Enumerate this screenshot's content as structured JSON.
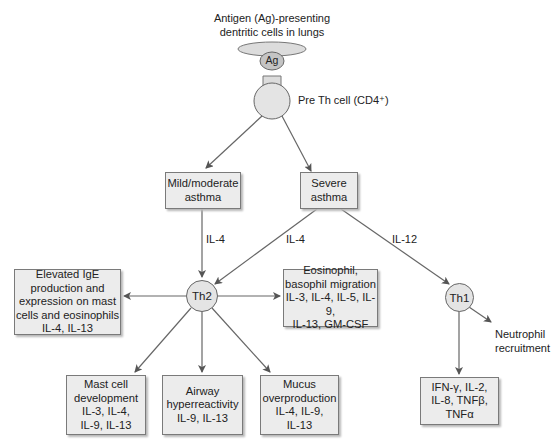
{
  "title": "Antigen (Ag)-presenting\ndentritic cells in lungs",
  "antigen_label": "Ag",
  "pre_th_label": "Pre Th cell (CD4⁺)",
  "nodes": {
    "mild": "Mild/moderate\nasthma",
    "severe": "Severe\nasthma",
    "th2": "Th2",
    "th1": "Th1",
    "ige": "Elevated IgE\nproduction and\nexpression on mast\ncells and eosinophils\nIL-4, IL-13",
    "eosinophil": "Eosinophil,\nbasophil migration\nIL-3, IL-4, IL-5, IL-9,\nIL-13, GM-CSF",
    "mast": "Mast cell\ndevelopment\nIL-3, IL-4,\nIL-9, IL-13",
    "airway": "Airway\nhyperreactivity\nIL-9, IL-13",
    "mucus": "Mucus\noverproduction\nIL-4, IL-9,\nIL-13",
    "th1_cytokines": "IFN-γ, IL-2,\nIL-8, TNFβ,\nTNFα",
    "neutrophil": "Neutrophil\nrecruitment"
  },
  "edge_labels": {
    "mild_to_th2": "IL-4",
    "severe_to_th2": "IL-4",
    "severe_to_th1": "IL-12"
  },
  "colors": {
    "box_fill": "#ececec",
    "box_border": "#7a7a7a",
    "line": "#666666",
    "cell_fill": "#e4e4e4",
    "antigen_fill": "#c4c4c4"
  }
}
